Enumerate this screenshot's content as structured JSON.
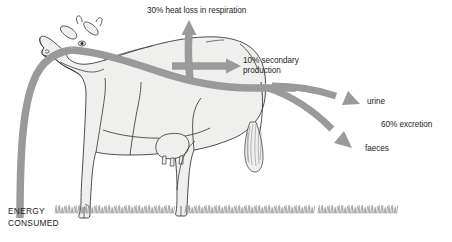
{
  "diagram": {
    "colors": {
      "arrow": "#9a9a9a",
      "arrow_light": "#b5b5b5",
      "body_fill": "#efefee",
      "outline": "#3b3b3b",
      "grass": "#8d8d8d",
      "text": "#231f20",
      "background": "#ffffff"
    },
    "labels": {
      "heat_loss": "30% heat loss in respiration",
      "secondary_production_line1": "10% secondary",
      "secondary_production_line2": "production",
      "urine": "urine",
      "excretion": "60% excretion",
      "faeces": "faeces",
      "energy_line1": "ENERGY",
      "energy_line2": "CONSUMED"
    },
    "flows": [
      {
        "name": "energy-consumed",
        "percent": null,
        "label": "ENERGY CONSUMED",
        "direction": "into-mouth"
      },
      {
        "name": "heat-loss-respiration",
        "percent": 30,
        "label": "30% heat loss in respiration",
        "direction": "up"
      },
      {
        "name": "secondary-production",
        "percent": 10,
        "label": "10% secondary production",
        "direction": "right"
      },
      {
        "name": "urine",
        "percent": null,
        "label": "urine",
        "direction": "down-right"
      },
      {
        "name": "faeces",
        "percent": null,
        "label": "faeces",
        "direction": "down-right"
      },
      {
        "name": "excretion-total",
        "percent": 60,
        "label": "60% excretion",
        "direction": "down-right"
      }
    ]
  }
}
